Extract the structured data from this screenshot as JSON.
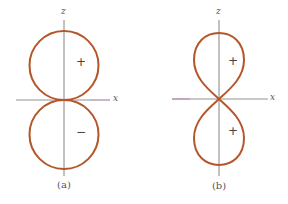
{
  "colors": {
    "lobe": "#b5562a",
    "axis": "#666666",
    "axis_tint_a": "#c9a0d0",
    "axis_tint_b": "#c070c0",
    "text": "#555555"
  },
  "figures": [
    {
      "id": "a",
      "caption": "(a)",
      "axis_labels": {
        "z": "z",
        "x": "x"
      },
      "upper_lobe": {
        "shape": "circle",
        "sign": "+"
      },
      "lower_lobe": {
        "shape": "circle",
        "sign": "−"
      }
    },
    {
      "id": "b",
      "caption": "(b)",
      "axis_labels": {
        "z": "z",
        "x": "x"
      },
      "upper_lobe": {
        "shape": "teardrop",
        "sign": "+"
      },
      "lower_lobe": {
        "shape": "teardrop",
        "sign": "+"
      }
    }
  ]
}
